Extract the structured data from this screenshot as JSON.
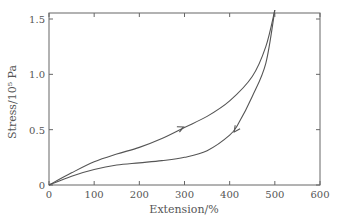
{
  "chart_data": {
    "type": "line",
    "title": "",
    "xlabel": "Extension/%",
    "ylabel": "Stress/10⁵ Pa",
    "xlim": [
      0,
      600
    ],
    "ylim": [
      0,
      1.57
    ],
    "x_ticks": [
      0,
      100,
      200,
      300,
      400,
      500,
      600
    ],
    "y_ticks": [
      0,
      0.5,
      1.0,
      1.5
    ],
    "x_tick_labels": [
      "0",
      "100",
      "200",
      "300",
      "400",
      "500",
      "600"
    ],
    "y_tick_labels": [
      "0",
      "0.5",
      "1.0",
      "1.5"
    ],
    "grid": false,
    "legend": null,
    "series": [
      {
        "name": "loading",
        "direction": "increasing extension (arrow at ~300%)",
        "x": [
          0,
          50,
          100,
          150,
          200,
          250,
          300,
          350,
          400,
          450,
          480,
          500
        ],
        "y": [
          0,
          0.11,
          0.21,
          0.28,
          0.34,
          0.42,
          0.52,
          0.62,
          0.76,
          0.98,
          1.25,
          1.58
        ]
      },
      {
        "name": "unloading",
        "direction": "decreasing extension (arrow at ~410%)",
        "x": [
          500,
          480,
          450,
          420,
          400,
          350,
          300,
          250,
          200,
          150,
          100,
          50,
          0
        ],
        "y": [
          1.58,
          1.1,
          0.8,
          0.56,
          0.45,
          0.31,
          0.25,
          0.22,
          0.2,
          0.18,
          0.14,
          0.08,
          0
        ]
      }
    ]
  }
}
